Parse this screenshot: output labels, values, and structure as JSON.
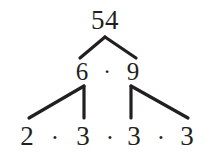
{
  "figure": {
    "name": "factor-tree",
    "subject": "54",
    "ink_color": "#231f20",
    "background_color": "#ffffff",
    "width": 208,
    "height": 155
  },
  "levels": {
    "root": {
      "nodes": [
        {
          "label": "54",
          "x": 105,
          "y": 20
        }
      ]
    },
    "middle": {
      "nodes": [
        {
          "label": "6",
          "x": 82,
          "y": 71
        },
        {
          "label": "9",
          "x": 133,
          "y": 71
        }
      ],
      "operators": [
        {
          "label": "·",
          "x": 107,
          "y": 71
        }
      ]
    },
    "leaves": {
      "nodes": [
        {
          "label": "2",
          "x": 27,
          "y": 136
        },
        {
          "label": "3",
          "x": 83,
          "y": 136
        },
        {
          "label": "3",
          "x": 134,
          "y": 136
        },
        {
          "label": "3",
          "x": 187,
          "y": 136
        }
      ],
      "operators": [
        {
          "label": "·",
          "x": 55,
          "y": 137
        },
        {
          "label": "·",
          "x": 110,
          "y": 137
        },
        {
          "label": "·",
          "x": 161,
          "y": 137
        }
      ]
    }
  },
  "edges": [
    {
      "name": "edge-54-to-6",
      "x1": 105,
      "y1": 37,
      "x2": 80,
      "y2": 58
    },
    {
      "name": "edge-54-to-9",
      "x1": 105,
      "y1": 37,
      "x2": 136,
      "y2": 58
    },
    {
      "name": "edge-6-to-2",
      "x1": 84,
      "y1": 86,
      "x2": 29,
      "y2": 118
    },
    {
      "name": "edge-6-to-3",
      "x1": 84,
      "y1": 86,
      "x2": 84,
      "y2": 118
    },
    {
      "name": "edge-9-to-3",
      "x1": 131,
      "y1": 86,
      "x2": 131,
      "y2": 118
    },
    {
      "name": "edge-9-to-3-right",
      "x1": 131,
      "y1": 86,
      "x2": 188,
      "y2": 118
    }
  ],
  "expression": {
    "product_middle": "6 · 9",
    "product_leaves": "2 · 3 · 3 · 3"
  }
}
